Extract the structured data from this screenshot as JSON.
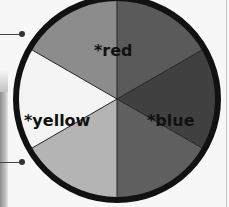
{
  "wheel": {
    "center": [
      117,
      99
    ],
    "radius": 101,
    "border_width": 6,
    "border_color": "#111111",
    "divider_color": "#222222",
    "segments": [
      {
        "name": "orange",
        "color": "#8c8c8c",
        "start_deg": 210,
        "end_deg": 270
      },
      {
        "name": "red",
        "color": "#5a5a5a",
        "start_deg": 270,
        "end_deg": 330
      },
      {
        "name": "violet",
        "color": "#404040",
        "start_deg": 330,
        "end_deg": 390
      },
      {
        "name": "blue",
        "color": "#5f5f5f",
        "start_deg": 30,
        "end_deg": 90
      },
      {
        "name": "green",
        "color": "#b4b4b4",
        "start_deg": 90,
        "end_deg": 150
      },
      {
        "name": "yellow",
        "color": "#f4f4f4",
        "start_deg": 150,
        "end_deg": 210
      }
    ],
    "labels": {
      "red": "*red",
      "yellow": "*yellow",
      "blue": "*blue"
    }
  },
  "connectors": [
    {
      "y": 34,
      "x_end": 22
    },
    {
      "y": 162,
      "x_end": 22
    }
  ]
}
